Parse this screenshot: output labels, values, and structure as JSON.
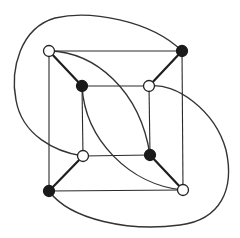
{
  "diagram": {
    "type": "graph",
    "colors": {
      "white_vertex_fill": "#ffffff",
      "black_vertex_fill": "#1a1a1a",
      "edge": "#2a2a2a"
    },
    "vertices": [
      {
        "id": "outer-tl",
        "x": 49,
        "y": 51,
        "color": "white"
      },
      {
        "id": "outer-tr",
        "x": 182,
        "y": 51,
        "color": "black"
      },
      {
        "id": "outer-bl",
        "x": 49,
        "y": 191,
        "color": "black"
      },
      {
        "id": "outer-br",
        "x": 183,
        "y": 190,
        "color": "white"
      },
      {
        "id": "inner-tl",
        "x": 82,
        "y": 86,
        "color": "black"
      },
      {
        "id": "inner-tr",
        "x": 149,
        "y": 86,
        "color": "white"
      },
      {
        "id": "inner-bl",
        "x": 83,
        "y": 156,
        "color": "white"
      },
      {
        "id": "inner-br",
        "x": 150,
        "y": 155,
        "color": "black"
      }
    ],
    "edges": [
      {
        "from": "outer-tl",
        "to": "outer-tr",
        "kind": "straight"
      },
      {
        "from": "outer-tr",
        "to": "outer-br",
        "kind": "straight"
      },
      {
        "from": "outer-br",
        "to": "outer-bl",
        "kind": "straight"
      },
      {
        "from": "outer-bl",
        "to": "outer-tl",
        "kind": "straight"
      },
      {
        "from": "inner-tl",
        "to": "inner-tr",
        "kind": "straight"
      },
      {
        "from": "inner-tr",
        "to": "inner-br",
        "kind": "straight"
      },
      {
        "from": "inner-br",
        "to": "inner-bl",
        "kind": "straight"
      },
      {
        "from": "inner-bl",
        "to": "inner-tl",
        "kind": "straight"
      },
      {
        "from": "outer-tl",
        "to": "inner-tl",
        "kind": "spoke"
      },
      {
        "from": "outer-tr",
        "to": "inner-tr",
        "kind": "spoke"
      },
      {
        "from": "outer-bl",
        "to": "inner-bl",
        "kind": "spoke"
      },
      {
        "from": "outer-br",
        "to": "inner-br",
        "kind": "spoke"
      },
      {
        "from": "outer-tl",
        "to": "inner-br",
        "kind": "curve"
      },
      {
        "from": "inner-tl",
        "to": "outer-br",
        "kind": "curve"
      },
      {
        "from": "outer-tr",
        "to": "inner-bl",
        "kind": "curve-outer-loop"
      },
      {
        "from": "inner-tr",
        "to": "outer-bl",
        "kind": "curve-outer-loop"
      }
    ]
  }
}
